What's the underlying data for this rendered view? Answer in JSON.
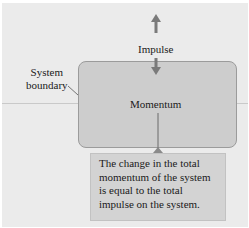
{
  "diagram": {
    "labels": {
      "impulse": "Impulse",
      "momentum": "Momentum",
      "system_boundary_line1": "System",
      "system_boundary_line2": "boundary"
    },
    "callout": {
      "lines": [
        "The change in the total",
        "momentum of the system",
        "is equal to the total",
        "impulse on the system."
      ]
    },
    "arrows": [
      {
        "name": "impulse-out-arrow",
        "direction": "up"
      },
      {
        "name": "impulse-in-arrow",
        "direction": "down"
      }
    ],
    "colors": {
      "background": "#ebebeb",
      "system_box_fill": "#cdcdcd",
      "system_box_border": "#9b9b9b",
      "callout_fill": "#d3d3d3",
      "arrow": "#7a7a7a"
    }
  }
}
